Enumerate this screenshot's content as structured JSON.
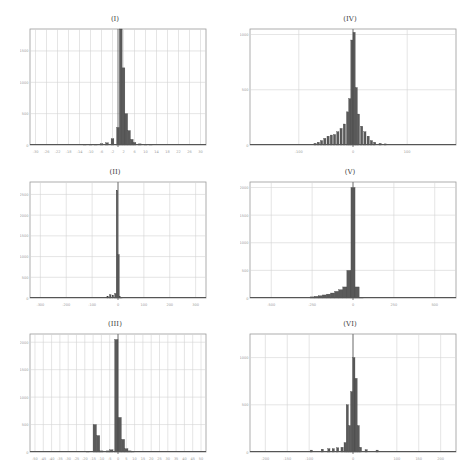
{
  "chart_data": [
    {
      "type": "bar",
      "title": "(I)",
      "xlabel": "",
      "ylabel": "",
      "grid": true,
      "x_ticks": [
        "-30",
        "-26",
        "-22",
        "-18",
        "-14",
        "-10",
        "-6",
        "-2",
        "2",
        "6",
        "10",
        "14",
        "18",
        "22",
        "26",
        "30"
      ],
      "y_ticks": [
        "0",
        "500",
        "1000",
        "1500"
      ],
      "xlim": [
        -32,
        32
      ],
      "ylim": [
        0,
        1850
      ],
      "bins": [
        {
          "x": -12,
          "h": 5
        },
        {
          "x": -10,
          "h": 8
        },
        {
          "x": -8,
          "h": 12
        },
        {
          "x": -6,
          "h": 20
        },
        {
          "x": -4,
          "h": 35
        },
        {
          "x": -2,
          "h": 100
        },
        {
          "x": 0,
          "h": 280
        },
        {
          "x": 1,
          "h": 1850
        },
        {
          "x": 2,
          "h": 1230
        },
        {
          "x": 3,
          "h": 500
        },
        {
          "x": 4,
          "h": 230
        },
        {
          "x": 5,
          "h": 90
        },
        {
          "x": 6,
          "h": 40
        },
        {
          "x": 8,
          "h": 18
        },
        {
          "x": 10,
          "h": 10
        },
        {
          "x": 12,
          "h": 6
        }
      ],
      "bin_width": 1
    },
    {
      "type": "bar",
      "title": "(IV)",
      "xlabel": "",
      "ylabel": "",
      "grid": true,
      "x_ticks": [
        "-100",
        "0",
        "100"
      ],
      "y_ticks": [
        "0",
        "500",
        "1000"
      ],
      "xlim": [
        -190,
        190
      ],
      "ylim": [
        0,
        1050
      ],
      "bins": [
        {
          "x": -70,
          "h": 15
        },
        {
          "x": -64,
          "h": 25
        },
        {
          "x": -58,
          "h": 40
        },
        {
          "x": -52,
          "h": 60
        },
        {
          "x": -46,
          "h": 80
        },
        {
          "x": -40,
          "h": 90
        },
        {
          "x": -34,
          "h": 95
        },
        {
          "x": -28,
          "h": 120
        },
        {
          "x": -22,
          "h": 150
        },
        {
          "x": -16,
          "h": 190
        },
        {
          "x": -10,
          "h": 300
        },
        {
          "x": -6,
          "h": 420
        },
        {
          "x": -2,
          "h": 950
        },
        {
          "x": 2,
          "h": 1020
        },
        {
          "x": 6,
          "h": 520
        },
        {
          "x": 10,
          "h": 280
        },
        {
          "x": 16,
          "h": 170
        },
        {
          "x": 22,
          "h": 120
        },
        {
          "x": 28,
          "h": 80
        },
        {
          "x": 34,
          "h": 40
        },
        {
          "x": 40,
          "h": 25
        },
        {
          "x": 50,
          "h": 15
        },
        {
          "x": 60,
          "h": 10
        }
      ],
      "bin_width": 4
    },
    {
      "type": "bar",
      "title": "(II)",
      "xlabel": "",
      "ylabel": "",
      "grid": true,
      "x_ticks": [
        "-300",
        "-200",
        "-100",
        "0",
        "100",
        "200",
        "300"
      ],
      "y_ticks": [
        "0",
        "500",
        "1000",
        "1500",
        "2000",
        "2500"
      ],
      "xlim": [
        -340,
        340
      ],
      "ylim": [
        0,
        2800
      ],
      "bins": [
        {
          "x": -40,
          "h": 40
        },
        {
          "x": -30,
          "h": 80
        },
        {
          "x": -20,
          "h": 70
        },
        {
          "x": -10,
          "h": 110
        },
        {
          "x": -4,
          "h": 2600
        },
        {
          "x": 2,
          "h": 1050
        },
        {
          "x": 8,
          "h": 30
        },
        {
          "x": 14,
          "h": 15
        }
      ],
      "bin_width": 6
    },
    {
      "type": "bar",
      "title": "(V)",
      "xlabel": "",
      "ylabel": "",
      "grid": true,
      "x_ticks": [
        "-500",
        "-250",
        "0",
        "250",
        "500"
      ],
      "y_ticks": [
        "0",
        "500",
        "1000",
        "1500",
        "2000"
      ],
      "xlim": [
        -630,
        630
      ],
      "ylim": [
        0,
        2100
      ],
      "bins": [
        {
          "x": -250,
          "h": 20
        },
        {
          "x": -225,
          "h": 30
        },
        {
          "x": -200,
          "h": 40
        },
        {
          "x": -175,
          "h": 55
        },
        {
          "x": -150,
          "h": 70
        },
        {
          "x": -125,
          "h": 90
        },
        {
          "x": -100,
          "h": 120
        },
        {
          "x": -75,
          "h": 150
        },
        {
          "x": -50,
          "h": 200
        },
        {
          "x": -25,
          "h": 500
        },
        {
          "x": 0,
          "h": 2000
        },
        {
          "x": 25,
          "h": 200
        },
        {
          "x": 50,
          "h": 15
        }
      ],
      "bin_width": 25
    },
    {
      "type": "bar",
      "title": "(III)",
      "xlabel": "",
      "ylabel": "",
      "grid": true,
      "x_ticks": [
        "-50",
        "-45",
        "-40",
        "-35",
        "-30",
        "-25",
        "-20",
        "-15",
        "-10",
        "-5",
        "0",
        "5",
        "10",
        "15",
        "20",
        "25",
        "30",
        "35",
        "40",
        "45",
        "50"
      ],
      "y_ticks": [
        "0",
        "500",
        "1000",
        "1500",
        "2000"
      ],
      "xlim": [
        -53,
        53
      ],
      "ylim": [
        0,
        2150
      ],
      "bins": [
        {
          "x": -18,
          "h": 15
        },
        {
          "x": -14,
          "h": 500
        },
        {
          "x": -12,
          "h": 300
        },
        {
          "x": -10,
          "h": 20
        },
        {
          "x": -6,
          "h": 20
        },
        {
          "x": -4,
          "h": 40
        },
        {
          "x": -1,
          "h": 2050
        },
        {
          "x": 1,
          "h": 630
        },
        {
          "x": 3,
          "h": 230
        },
        {
          "x": 5,
          "h": 60
        },
        {
          "x": 7,
          "h": 20
        },
        {
          "x": 9,
          "h": 10
        }
      ],
      "bin_width": 2
    },
    {
      "type": "bar",
      "title": "(VI)",
      "xlabel": "",
      "ylabel": "",
      "grid": true,
      "x_ticks": [
        "-200",
        "-150",
        "-100",
        "0",
        "100",
        "150",
        "200"
      ],
      "y_ticks": [
        "0",
        "500",
        "1000"
      ],
      "xlim": [
        -235,
        235
      ],
      "ylim": [
        0,
        1250
      ],
      "bins": [
        {
          "x": -95,
          "h": 20
        },
        {
          "x": -70,
          "h": 30
        },
        {
          "x": -55,
          "h": 35
        },
        {
          "x": -45,
          "h": 35
        },
        {
          "x": -35,
          "h": 45
        },
        {
          "x": -25,
          "h": 50
        },
        {
          "x": -18,
          "h": 100
        },
        {
          "x": -13,
          "h": 500
        },
        {
          "x": -8,
          "h": 280
        },
        {
          "x": -3,
          "h": 640
        },
        {
          "x": 2,
          "h": 1000
        },
        {
          "x": 7,
          "h": 780
        },
        {
          "x": 12,
          "h": 280
        },
        {
          "x": 17,
          "h": 50
        },
        {
          "x": 30,
          "h": 25
        },
        {
          "x": 55,
          "h": 20
        }
      ],
      "bin_width": 5
    }
  ],
  "panels": [
    {
      "id": "I",
      "title": "(I)"
    },
    {
      "id": "IV",
      "title": "(IV)"
    },
    {
      "id": "II",
      "title": "(II)"
    },
    {
      "id": "V",
      "title": "(V)"
    },
    {
      "id": "III",
      "title": "(III)"
    },
    {
      "id": "VI",
      "title": "(VI)"
    }
  ],
  "style": {
    "bar_color": "#5a5a5a",
    "bar_edge": "#3a3a3a",
    "grid_color": "#d4d4d4",
    "axis_color": "#555555",
    "frame_color": "#9a9a9a"
  }
}
